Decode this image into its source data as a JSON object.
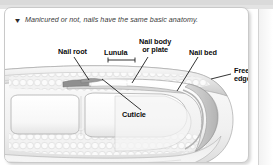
{
  "page": {
    "background_color": "#ffffff",
    "panel_border_color": "#c9c9c9"
  },
  "caption": {
    "marker_icon": "triangle-down-icon",
    "marker_glyph": "▼",
    "text": "Manicured or not, nails have the same basic anatomy."
  },
  "figure": {
    "type": "anatomical-diagram",
    "view": "sagittal cross-section of fingertip and nail",
    "palette": {
      "skin_light": "#f4f4f4",
      "skin_mid": "#e0e0e0",
      "skin_shadow": "#c4c4c4",
      "nail_plate": "#fbfbfb",
      "nail_edge": "#b8b8b8",
      "bone": "#fdfdfd",
      "papillae": "#ededed",
      "outline": "#9a9a9a",
      "leader_line": "#1a1a1a",
      "label_text": "#0b0b0b"
    },
    "labels": [
      {
        "id": "nail-root",
        "text": "Nail root",
        "lines": [
          "Nail root"
        ]
      },
      {
        "id": "lunula",
        "text": "Lunula",
        "lines": [
          "Lunula"
        ],
        "has_bracket": true
      },
      {
        "id": "nail-body",
        "text": "Nail body or plate",
        "lines": [
          "Nail body",
          "or plate"
        ]
      },
      {
        "id": "nail-bed",
        "text": "Nail bed",
        "lines": [
          "Nail bed"
        ]
      },
      {
        "id": "free-edge",
        "text": "Free edge",
        "lines": [
          "Free",
          "edge"
        ]
      },
      {
        "id": "cuticle",
        "text": "Cuticle",
        "lines": [
          "Cuticle"
        ]
      }
    ],
    "label_text": {
      "nail_root": "Nail root",
      "lunula": "Lunula",
      "nail_body_line1": "Nail body",
      "nail_body_line2": "or plate",
      "nail_bed": "Nail bed",
      "free_edge_line1": "Free",
      "free_edge_line2": "edge",
      "cuticle": "Cuticle"
    }
  }
}
